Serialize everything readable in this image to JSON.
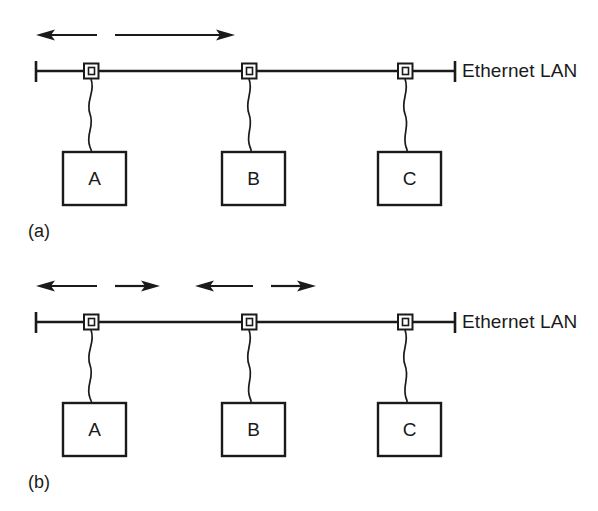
{
  "figure": {
    "ink_color": "#1a1a1a",
    "background_color": "#ffffff",
    "panels": [
      {
        "id": "a",
        "label": "(a)",
        "bus_label": "Ethernet LAN",
        "stations": [
          "A",
          "B",
          "C"
        ],
        "arrow_groups": [
          {
            "left_label": "",
            "right_label": "",
            "segments": 2
          }
        ]
      },
      {
        "id": "b",
        "label": "(b)",
        "bus_label": "Ethernet LAN",
        "stations": [
          "A",
          "B",
          "C"
        ],
        "arrow_groups": [
          {
            "left_label": "",
            "right_label": "",
            "segments": 2
          },
          {
            "left_label": "",
            "right_label": "",
            "segments": 2
          }
        ]
      }
    ]
  },
  "panel_a": {
    "label": "(a)",
    "lan_label": "Ethernet LAN",
    "station_a": "A",
    "station_b": "B",
    "station_c": "C"
  },
  "panel_b": {
    "label": "(b)",
    "lan_label": "Ethernet LAN",
    "station_a": "A",
    "station_b": "B",
    "station_c": "C"
  }
}
